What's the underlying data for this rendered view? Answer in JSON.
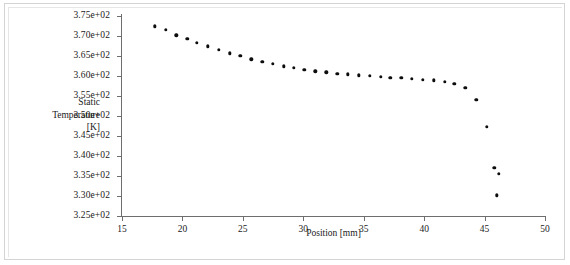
{
  "chart_data": {
    "type": "scatter",
    "title": "",
    "xlabel": "Position [mm]",
    "ylabel": "Static Temperature [K]",
    "ylabel_lines": [
      "Static",
      "Temperature",
      "[K]"
    ],
    "xlim": [
      15,
      50
    ],
    "ylim": [
      325,
      375
    ],
    "grid": false,
    "legend": null,
    "xticks": [
      15,
      20,
      25,
      30,
      35,
      40,
      45,
      50
    ],
    "xtick_labels": [
      "15",
      "20",
      "25",
      "30",
      "35",
      "40",
      "45",
      "50"
    ],
    "yticks": [
      325,
      330,
      335,
      340,
      345,
      350,
      355,
      360,
      365,
      370,
      375
    ],
    "ytick_labels": [
      "3.25e+02",
      "3.30e+02",
      "3.35e+02",
      "3.40e+02",
      "3.45e+02",
      "3.50e+02",
      "3.55e+02",
      "3.60e+02",
      "3.65e+02",
      "3.70e+02",
      "3.75e+02"
    ],
    "marker": "filled-circle",
    "marker_color": "#0d0d0d",
    "axis_color": "#6e6e6e",
    "background_color": "#ffffff",
    "series": [
      {
        "name": "Static Temperature",
        "x": [
          17.7,
          18.6,
          19.5,
          20.4,
          21.2,
          22.1,
          23.0,
          23.9,
          24.8,
          25.7,
          26.6,
          27.5,
          28.4,
          29.2,
          30.1,
          31.0,
          31.9,
          32.8,
          33.7,
          34.6,
          35.5,
          36.4,
          37.2,
          38.1,
          39.0,
          39.9,
          40.8,
          41.7,
          42.5,
          43.4,
          44.3,
          45.2,
          45.8
        ],
        "y": [
          372.4,
          371.5,
          370.2,
          369.3,
          368.3,
          367.4,
          366.5,
          365.7,
          365.0,
          364.2,
          363.5,
          363.0,
          362.4,
          362.0,
          361.6,
          361.2,
          360.9,
          360.6,
          360.4,
          360.2,
          360.0,
          359.8,
          359.6,
          359.5,
          359.3,
          359.1,
          358.9,
          358.6,
          358.1,
          357.0,
          354.0,
          347.3,
          337.0
        ]
      },
      {
        "name": "Static Temperature tail",
        "x": [
          46.2,
          46.0
        ],
        "y": [
          335.5,
          330.2
        ]
      }
    ]
  }
}
